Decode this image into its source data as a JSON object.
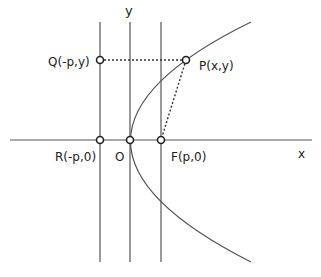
{
  "diagram": {
    "type": "parabola-focus-directrix",
    "colors": {
      "line": "#555555",
      "text": "#222222",
      "point_fill": "#ffffff"
    },
    "axes": {
      "x_label": "x",
      "y_label": "y"
    },
    "points": {
      "Q": {
        "label": "Q(-p,y)"
      },
      "P": {
        "label": "P(x,y)"
      },
      "R": {
        "label": "R(-p,0)"
      },
      "O": {
        "label": "O"
      },
      "F": {
        "label": "F(p,0)"
      }
    },
    "lines": {
      "directrix": "x = -p",
      "y_axis": "x = 0",
      "focus_vertical": "x = p",
      "QP_segment": "dotted horizontal",
      "PF_segment": "dotted"
    }
  }
}
